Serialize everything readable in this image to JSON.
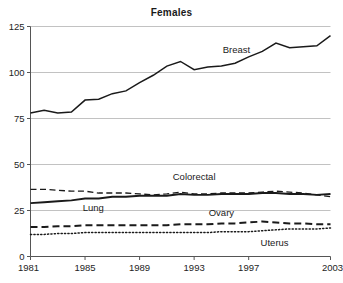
{
  "chart_data": {
    "type": "line",
    "title": "Females",
    "xlabel": "",
    "ylabel": "",
    "xlim": [
      1981,
      2003
    ],
    "ylim": [
      0,
      125
    ],
    "grid": true,
    "legend_position": "inline-annotations",
    "y_ticks": [
      0,
      25,
      50,
      75,
      100,
      125
    ],
    "y_tick_labels": [
      "0",
      "25",
      "50",
      "75",
      "100",
      "125"
    ],
    "x_ticks": [
      1981,
      1985,
      1989,
      1993,
      1997,
      2003
    ],
    "x_tick_labels": [
      "1981",
      "1985",
      "1989",
      "1993",
      "1997",
      "2003"
    ],
    "x": [
      1981,
      1982,
      1983,
      1984,
      1985,
      1986,
      1987,
      1988,
      1989,
      1990,
      1991,
      1992,
      1993,
      1994,
      1995,
      1996,
      1997,
      1998,
      1999,
      2000,
      2001,
      2002,
      2003
    ],
    "series": [
      {
        "name": "Breast",
        "style": "solid",
        "label": "Breast",
        "values": [
          78.0,
          79.5,
          78.0,
          78.5,
          85.0,
          85.5,
          88.5,
          90.0,
          94.5,
          98.5,
          103.5,
          106.0,
          101.5,
          103.0,
          103.5,
          105.0,
          108.5,
          111.5,
          116.0,
          113.5,
          114.0,
          114.5,
          120.0
        ]
      },
      {
        "name": "Colorectal",
        "style": "dashed",
        "label": "Colorectal",
        "values": [
          36.5,
          36.5,
          36.0,
          35.5,
          35.5,
          34.5,
          34.5,
          34.5,
          34.0,
          33.5,
          34.0,
          35.0,
          34.0,
          34.0,
          34.5,
          34.5,
          34.5,
          35.0,
          35.5,
          35.0,
          34.5,
          33.5,
          32.5
        ]
      },
      {
        "name": "Lung",
        "style": "solid-bold",
        "label": "Lung",
        "values": [
          29.0,
          29.5,
          30.0,
          30.5,
          31.5,
          31.5,
          32.5,
          32.5,
          33.0,
          33.0,
          33.0,
          34.0,
          33.5,
          33.5,
          34.0,
          34.0,
          34.0,
          34.5,
          34.5,
          34.0,
          34.0,
          33.5,
          34.0
        ]
      },
      {
        "name": "Ovary",
        "style": "bold-dashed",
        "label": "Ovary",
        "values": [
          16.0,
          16.0,
          16.5,
          16.5,
          17.0,
          17.0,
          17.0,
          17.0,
          17.0,
          17.0,
          17.0,
          17.5,
          17.5,
          17.5,
          18.0,
          18.0,
          18.5,
          19.0,
          18.5,
          18.0,
          18.0,
          17.5,
          17.5
        ]
      },
      {
        "name": "Uterus",
        "style": "dotted",
        "label": "Uterus",
        "values": [
          12.0,
          12.0,
          12.5,
          12.5,
          13.0,
          13.0,
          13.0,
          13.0,
          13.0,
          13.0,
          13.0,
          13.0,
          13.0,
          13.0,
          13.5,
          13.5,
          13.5,
          14.0,
          14.5,
          15.0,
          15.0,
          15.0,
          15.5
        ]
      }
    ],
    "annotations": [
      {
        "text": "Breast",
        "x": 1996.1,
        "y": 110.5
      },
      {
        "text": "Colorectal",
        "x": 1993.0,
        "y": 41.5
      },
      {
        "text": "Lung",
        "x": 1985.6,
        "y": 24.5
      },
      {
        "text": "Ovary",
        "x": 1995.0,
        "y": 22.0
      },
      {
        "text": "Uterus",
        "x": 1998.9,
        "y": 5.5
      }
    ],
    "colors": {
      "line": "#1a1a1a",
      "grid": "#b3b3b3",
      "axis": "#555555",
      "background": "#ffffff",
      "text": "#1a1a1a"
    }
  }
}
